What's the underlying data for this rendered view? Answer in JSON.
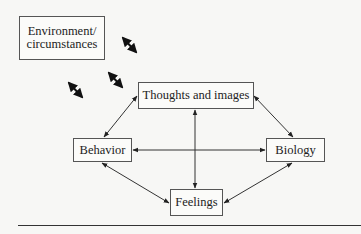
{
  "diagram": {
    "title": "",
    "nodes": [
      {
        "id": "environment",
        "label_line1": "Environment/",
        "label_line2": "circumstances"
      },
      {
        "id": "thoughts",
        "label": "Thoughts and images"
      },
      {
        "id": "behavior",
        "label": "Behavior"
      },
      {
        "id": "biology",
        "label": "Biology"
      },
      {
        "id": "feelings",
        "label": "Feelings"
      }
    ],
    "edges": [
      {
        "from": "thoughts",
        "to": "behavior",
        "type": "bidirectional"
      },
      {
        "from": "thoughts",
        "to": "biology",
        "type": "bidirectional"
      },
      {
        "from": "thoughts",
        "to": "feelings",
        "type": "bidirectional"
      },
      {
        "from": "behavior",
        "to": "biology",
        "type": "bidirectional"
      },
      {
        "from": "behavior",
        "to": "feelings",
        "type": "bidirectional"
      },
      {
        "from": "biology",
        "to": "feelings",
        "type": "bidirectional"
      }
    ],
    "environment_arrows": 3,
    "colors": {
      "line": "#333333",
      "box_border": "#555555",
      "background": "#f7f7f5"
    }
  }
}
